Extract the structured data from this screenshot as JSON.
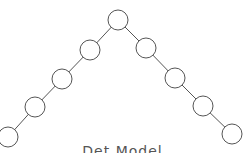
{
  "diagram": {
    "type": "tree",
    "shape": "inverted-v (two degenerate chains from root)",
    "node_radius": 10,
    "stroke_color": "#555555",
    "fill_color": "#ffffff",
    "nodes": [
      {
        "id": "root",
        "x": 118,
        "y": 20
      },
      {
        "id": "L1",
        "x": 90,
        "y": 50
      },
      {
        "id": "L2",
        "x": 62,
        "y": 79
      },
      {
        "id": "L3",
        "x": 35,
        "y": 107
      },
      {
        "id": "L4",
        "x": 8,
        "y": 137
      },
      {
        "id": "R1",
        "x": 146,
        "y": 48
      },
      {
        "id": "R2",
        "x": 175,
        "y": 78
      },
      {
        "id": "R3",
        "x": 203,
        "y": 106
      },
      {
        "id": "R4",
        "x": 232,
        "y": 134
      }
    ],
    "edges": [
      [
        "root",
        "L1"
      ],
      [
        "L1",
        "L2"
      ],
      [
        "L2",
        "L3"
      ],
      [
        "L3",
        "L4"
      ],
      [
        "root",
        "R1"
      ],
      [
        "R1",
        "R2"
      ],
      [
        "R2",
        "R3"
      ],
      [
        "R3",
        "R4"
      ]
    ]
  },
  "caption": "Det Model"
}
